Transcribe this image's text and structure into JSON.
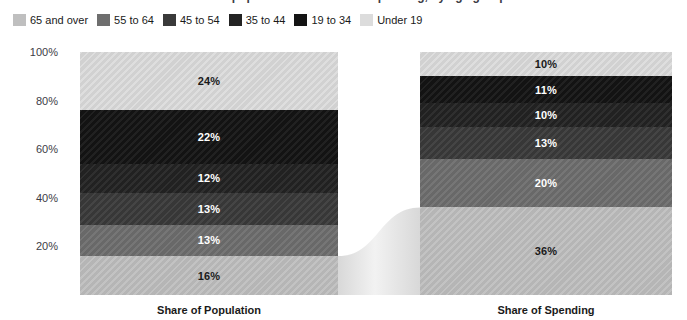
{
  "title": "Share of population and share of spending, by age group",
  "legend": {
    "items": [
      {
        "label": "65 and over",
        "color": "#bfbfbf"
      },
      {
        "label": "55 to 64",
        "color": "#6e6e6e"
      },
      {
        "label": "45 to 54",
        "color": "#3a3a3a"
      },
      {
        "label": "35 to 44",
        "color": "#232323"
      },
      {
        "label": "19 to 34",
        "color": "#141414"
      },
      {
        "label": "Under 19",
        "color": "#dcdcdc"
      }
    ]
  },
  "axes": {
    "y_ticks": [
      "100%",
      "80%",
      "60%",
      "40%",
      "20%"
    ],
    "x_labels": [
      "Share of Population",
      "Share of Spending"
    ]
  },
  "chart_data": {
    "type": "bar",
    "title": "Share of population and share of spending, by age group",
    "xlabel": "",
    "ylabel": "",
    "ylim": [
      0,
      100
    ],
    "grid": false,
    "stacked": true,
    "normalized_percent": true,
    "legend_position": "top-left",
    "categories": [
      "Share of Population",
      "Share of Spending"
    ],
    "series": [
      {
        "name": "Under 19",
        "color": "#dcdcdc",
        "text_color": "#1a1a1a",
        "values": [
          24,
          10
        ]
      },
      {
        "name": "19 to 34",
        "color": "#141414",
        "text_color": "#ffffff",
        "values": [
          22,
          11
        ]
      },
      {
        "name": "35 to 44",
        "color": "#232323",
        "text_color": "#ffffff",
        "values": [
          12,
          10
        ]
      },
      {
        "name": "45 to 54",
        "color": "#3a3a3a",
        "text_color": "#ffffff",
        "values": [
          13,
          13
        ]
      },
      {
        "name": "55 to 64",
        "color": "#6e6e6e",
        "text_color": "#ffffff",
        "values": [
          13,
          20
        ]
      },
      {
        "name": "65 and over",
        "color": "#bfbfbf",
        "text_color": "#1a1a1a",
        "values": [
          16,
          36
        ]
      }
    ],
    "bars": [
      {
        "category": "Share of Population",
        "segments": [
          {
            "name": "Under 19",
            "value": 24,
            "label": "24%",
            "color": "#dcdcdc",
            "text_color": "#1a1a1a"
          },
          {
            "name": "19 to 34",
            "value": 22,
            "label": "22%",
            "color": "#141414",
            "text_color": "#ffffff"
          },
          {
            "name": "35 to 44",
            "value": 12,
            "label": "12%",
            "color": "#232323",
            "text_color": "#ffffff"
          },
          {
            "name": "45 to 54",
            "value": 13,
            "label": "13%",
            "color": "#3a3a3a",
            "text_color": "#ffffff"
          },
          {
            "name": "55 to 64",
            "value": 13,
            "label": "13%",
            "color": "#6e6e6e",
            "text_color": "#ffffff"
          },
          {
            "name": "65 and over",
            "value": 16,
            "label": "16%",
            "color": "#bfbfbf",
            "text_color": "#1a1a1a"
          }
        ]
      },
      {
        "category": "Share of Spending",
        "segments": [
          {
            "name": "Under 19",
            "value": 10,
            "label": "10%",
            "color": "#dcdcdc",
            "text_color": "#1a1a1a"
          },
          {
            "name": "19 to 34",
            "value": 11,
            "label": "11%",
            "color": "#141414",
            "text_color": "#ffffff"
          },
          {
            "name": "35 to 44",
            "value": 10,
            "label": "10%",
            "color": "#232323",
            "text_color": "#ffffff"
          },
          {
            "name": "45 to 54",
            "value": 13,
            "label": "13%",
            "color": "#3a3a3a",
            "text_color": "#ffffff"
          },
          {
            "name": "55 to 64",
            "value": 20,
            "label": "20%",
            "color": "#6e6e6e",
            "text_color": "#ffffff"
          },
          {
            "name": "65 and over",
            "value": 36,
            "label": "36%",
            "color": "#bfbfbf",
            "text_color": "#1a1a1a"
          }
        ]
      }
    ]
  },
  "layout": {
    "plot_top": 52,
    "plot_bottom": 295,
    "bar1_left": 80,
    "bar1_right": 338,
    "bar2_left": 420,
    "bar2_right": 672,
    "ribbon_color": "#e9e9e9"
  }
}
